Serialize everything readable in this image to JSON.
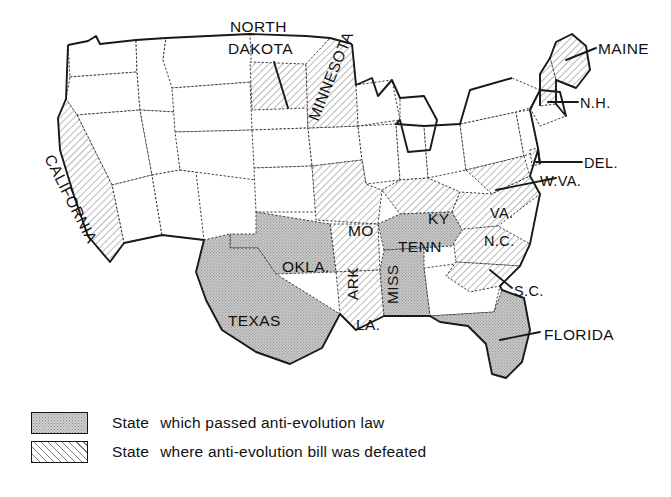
{
  "figure": {
    "type": "choropleth-map",
    "region": "United States",
    "title": ""
  },
  "legend": {
    "items": [
      {
        "swatch": "solid-gray-stipple",
        "lead": "State",
        "text": "which passed anti-evolution law",
        "category": "passed"
      },
      {
        "swatch": "diagonal-hatch",
        "lead": "State",
        "text": "where anti-evolution bill was defeated",
        "category": "defeated"
      }
    ]
  },
  "colors": {
    "passed_fill": "#c9c9c9",
    "defeated_fill": "#ffffff",
    "hatch_line": "#7d7d7d",
    "border": "#3a3a3a",
    "coast": "#1a1a1a",
    "text": "#111111",
    "background": "#ffffff"
  },
  "map_data": {
    "passed": [
      {
        "id": "TX",
        "label": "TEXAS"
      },
      {
        "id": "OK",
        "label": "OKLA."
      },
      {
        "id": "TN",
        "label": "TENN"
      },
      {
        "id": "MS",
        "label": "MISS"
      },
      {
        "id": "FL",
        "label": "FLORIDA"
      }
    ],
    "defeated": [
      {
        "id": "CA",
        "label": "CALIFORNIA"
      },
      {
        "id": "ND",
        "label": "NORTH DAKOTA"
      },
      {
        "id": "MN",
        "label": "MINNESOTA"
      },
      {
        "id": "MO",
        "label": "MO"
      },
      {
        "id": "AR",
        "label": "ARK"
      },
      {
        "id": "LA",
        "label": "LA."
      },
      {
        "id": "KY",
        "label": "KY"
      },
      {
        "id": "WV",
        "label": "W.VA."
      },
      {
        "id": "VA",
        "label": "VA."
      },
      {
        "id": "NC",
        "label": "N.C."
      },
      {
        "id": "SC",
        "label": "S.C."
      },
      {
        "id": "DE",
        "label": "DEL."
      },
      {
        "id": "ME",
        "label": "MAINE"
      },
      {
        "id": "NH",
        "label": "N.H."
      }
    ]
  },
  "labels": {
    "north_dakota": "NORTH",
    "dakota": "DAKOTA",
    "minnesota": "MINNESOTA",
    "california": "CALIFORNIA",
    "maine": "MAINE",
    "nh": "N.H.",
    "del": "DEL.",
    "wva": "W.VA.",
    "va": "VA.",
    "nc": "N.C.",
    "sc": "S.C.",
    "ky": "KY",
    "mo": "MO",
    "tenn": "TENN",
    "miss": "MISS",
    "ark": "ARK",
    "la": "LA.",
    "okla": "OKLA.",
    "texas": "TEXAS",
    "florida": "FLORIDA"
  }
}
